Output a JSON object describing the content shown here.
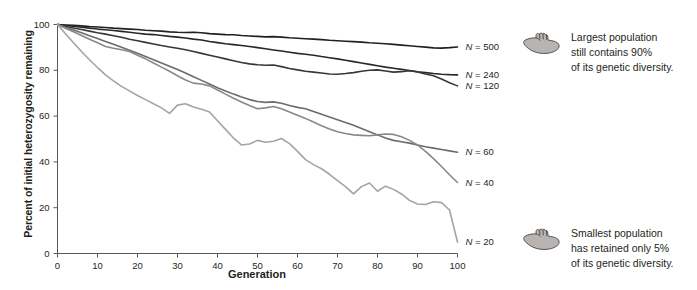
{
  "chart_data": {
    "type": "line",
    "title": "",
    "xlabel": "Generation",
    "ylabel": "Percent of initial heterozygosity remaining",
    "xlim": [
      0,
      100
    ],
    "ylim": [
      0,
      100
    ],
    "xticks": [
      0,
      10,
      20,
      30,
      40,
      50,
      60,
      70,
      80,
      90,
      100
    ],
    "yticks": [
      0,
      20,
      40,
      60,
      80,
      100
    ],
    "grid": false,
    "legend_position": "right-of-line-end",
    "series": [
      {
        "name": "N = 500",
        "label": "N = 500",
        "color": "#231f20",
        "end_value": 90,
        "x": [
          0,
          2,
          4,
          6,
          8,
          10,
          12,
          14,
          16,
          18,
          20,
          22,
          24,
          26,
          28,
          30,
          32,
          34,
          36,
          38,
          40,
          42,
          44,
          46,
          48,
          50,
          52,
          54,
          56,
          58,
          60,
          62,
          64,
          66,
          68,
          70,
          72,
          74,
          76,
          78,
          80,
          82,
          84,
          86,
          88,
          90,
          92,
          94,
          96,
          98,
          100
        ],
        "values": [
          100,
          99.8,
          99.6,
          99.4,
          99.1,
          98.9,
          98.7,
          98.4,
          98.2,
          98.0,
          97.8,
          97.5,
          97.3,
          97.1,
          96.8,
          96.6,
          96.5,
          96.6,
          96.4,
          96.0,
          95.8,
          95.6,
          95.5,
          95.2,
          95.0,
          94.8,
          94.6,
          94.7,
          94.5,
          94.2,
          94.0,
          93.8,
          93.6,
          93.4,
          93.1,
          92.9,
          92.7,
          92.5,
          92.3,
          92.0,
          91.8,
          91.6,
          91.3,
          91.0,
          90.7,
          90.4,
          90.1,
          89.8,
          89.7,
          89.9,
          90.2
        ]
      },
      {
        "name": "N = 240",
        "label": "N = 240",
        "color": "#2b2728",
        "end_value": 78,
        "x": [
          0,
          2,
          4,
          6,
          8,
          10,
          12,
          14,
          16,
          18,
          20,
          22,
          24,
          26,
          28,
          30,
          32,
          34,
          36,
          38,
          40,
          42,
          44,
          46,
          48,
          50,
          52,
          54,
          56,
          58,
          60,
          62,
          64,
          66,
          68,
          70,
          72,
          74,
          76,
          78,
          80,
          82,
          84,
          86,
          88,
          90,
          92,
          94,
          96,
          98,
          100
        ],
        "values": [
          100,
          99.6,
          99.2,
          98.8,
          98.4,
          98.0,
          97.7,
          97.4,
          97.0,
          96.6,
          96.2,
          95.8,
          95.6,
          95.2,
          94.8,
          94.5,
          94.1,
          93.6,
          93.2,
          92.6,
          92.1,
          91.6,
          91.2,
          90.8,
          90.4,
          89.9,
          89.4,
          88.9,
          88.4,
          87.9,
          87.4,
          87.0,
          86.6,
          86.0,
          85.5,
          85.0,
          84.4,
          83.8,
          83.2,
          82.6,
          82.0,
          81.4,
          80.9,
          80.4,
          79.9,
          79.4,
          79.0,
          78.6,
          78.3,
          78.1,
          78.0
        ]
      },
      {
        "name": "N = 120",
        "label": "N = 120",
        "color": "#3a3536",
        "end_value": 73,
        "x": [
          0,
          2,
          4,
          6,
          8,
          10,
          12,
          14,
          16,
          18,
          20,
          22,
          24,
          26,
          28,
          30,
          32,
          34,
          36,
          38,
          40,
          42,
          44,
          46,
          48,
          50,
          52,
          54,
          56,
          58,
          60,
          62,
          64,
          66,
          68,
          70,
          72,
          74,
          76,
          78,
          80,
          82,
          84,
          86,
          88,
          90,
          92,
          94,
          96,
          98,
          100
        ],
        "values": [
          100,
          99.2,
          98.5,
          97.8,
          97.1,
          96.4,
          95.8,
          95.1,
          94.4,
          93.6,
          92.9,
          92.2,
          91.5,
          90.8,
          90.2,
          89.6,
          89.0,
          88.2,
          87.4,
          86.6,
          85.8,
          85.0,
          84.2,
          83.4,
          82.8,
          82.4,
          82.2,
          82.3,
          81.6,
          80.8,
          80.2,
          79.6,
          79.2,
          78.8,
          78.4,
          78.3,
          78.6,
          79.0,
          79.6,
          80.0,
          80.2,
          79.7,
          79.2,
          79.4,
          79.8,
          79.3,
          78.4,
          77.6,
          76.2,
          74.6,
          73.2
        ]
      },
      {
        "name": "N = 60",
        "label": "N = 60",
        "color": "#6d6a6b",
        "end_value": 44,
        "x": [
          0,
          2,
          4,
          6,
          8,
          10,
          12,
          14,
          16,
          18,
          20,
          22,
          24,
          26,
          28,
          30,
          32,
          34,
          36,
          38,
          40,
          42,
          44,
          46,
          48,
          50,
          52,
          54,
          56,
          58,
          60,
          62,
          64,
          66,
          68,
          70,
          72,
          74,
          76,
          78,
          80,
          82,
          84,
          86,
          88,
          90,
          92,
          94,
          96,
          98,
          100
        ],
        "values": [
          100,
          98.8,
          97.6,
          96.4,
          95.1,
          93.9,
          92.6,
          91.4,
          90.1,
          88.8,
          87.4,
          86.0,
          84.6,
          83.2,
          81.8,
          80.3,
          78.8,
          77.2,
          75.6,
          74.0,
          72.4,
          71.0,
          69.6,
          68.3,
          67.2,
          66.4,
          66.0,
          66.2,
          65.6,
          64.6,
          63.8,
          63.2,
          62.0,
          60.8,
          59.6,
          58.4,
          57.2,
          56.0,
          54.6,
          53.2,
          51.8,
          50.4,
          49.4,
          48.8,
          48.2,
          47.4,
          46.6,
          46.0,
          45.4,
          44.8,
          44.2
        ]
      },
      {
        "name": "N = 40",
        "label": "N = 40",
        "color": "#8a8788",
        "end_value": 31,
        "x": [
          0,
          2,
          4,
          6,
          8,
          10,
          12,
          14,
          16,
          18,
          20,
          22,
          24,
          26,
          28,
          30,
          32,
          34,
          36,
          38,
          40,
          42,
          44,
          46,
          48,
          50,
          52,
          54,
          56,
          58,
          60,
          62,
          64,
          66,
          68,
          70,
          72,
          74,
          76,
          78,
          80,
          82,
          84,
          86,
          88,
          90,
          92,
          94,
          96,
          98,
          100
        ],
        "values": [
          100,
          98.4,
          96.8,
          95.2,
          93.6,
          92.0,
          90.4,
          89.6,
          89.0,
          88.2,
          86.6,
          85.0,
          83.2,
          81.4,
          79.6,
          77.6,
          75.8,
          74.4,
          74.0,
          73.2,
          71.4,
          69.6,
          67.8,
          66.2,
          64.6,
          63.2,
          63.6,
          64.2,
          63.2,
          61.8,
          60.4,
          59.0,
          57.4,
          55.8,
          54.4,
          53.2,
          52.4,
          51.8,
          51.6,
          51.4,
          51.8,
          52.2,
          52.0,
          51.0,
          49.4,
          47.4,
          44.6,
          41.4,
          38.0,
          34.4,
          31.0
        ]
      },
      {
        "name": "N = 20",
        "label": "N = 20",
        "color": "#a6a3a4",
        "end_value": 5,
        "x": [
          0,
          2,
          4,
          6,
          8,
          10,
          12,
          14,
          16,
          18,
          20,
          22,
          24,
          26,
          28,
          30,
          32,
          34,
          36,
          38,
          40,
          42,
          44,
          46,
          48,
          50,
          52,
          54,
          56,
          58,
          60,
          62,
          64,
          66,
          68,
          70,
          72,
          74,
          76,
          78,
          80,
          82,
          84,
          86,
          88,
          90,
          92,
          94,
          96,
          98,
          100
        ],
        "values": [
          100,
          96.0,
          92.0,
          88.2,
          84.6,
          81.2,
          78.0,
          75.4,
          73.0,
          71.0,
          69.0,
          67.2,
          65.4,
          63.6,
          61.2,
          64.8,
          65.4,
          64.0,
          63.0,
          61.8,
          58.0,
          54.2,
          50.4,
          47.4,
          47.8,
          49.4,
          48.6,
          49.0,
          50.2,
          48.0,
          44.6,
          41.0,
          38.8,
          37.0,
          34.6,
          31.8,
          29.2,
          26.0,
          29.2,
          30.8,
          27.2,
          29.4,
          28.0,
          26.0,
          23.2,
          21.6,
          21.4,
          22.6,
          22.2,
          19.0,
          5.0
        ]
      }
    ]
  },
  "series_labels": [
    {
      "text": "N = 500",
      "n": "N",
      "eq": " = 500"
    },
    {
      "text": "N = 240",
      "n": "N",
      "eq": " = 240"
    },
    {
      "text": "N = 120",
      "n": "N",
      "eq": " = 120"
    },
    {
      "text": "N = 60",
      "n": "N",
      "eq": " = 60"
    },
    {
      "text": "N = 40",
      "n": "N",
      "eq": " = 40"
    },
    {
      "text": "N = 20",
      "n": "N",
      "eq": " = 20"
    }
  ],
  "annotations": [
    {
      "icon": "pointing-hand-icon",
      "line1": "Largest population",
      "line2": "still contains 90%",
      "line3": "of its genetic diversity."
    },
    {
      "icon": "pointing-hand-icon",
      "line1": "Smallest population",
      "line2": "has retained only 5%",
      "line3": "of its genetic diversity."
    }
  ],
  "axes": {
    "x_title": "Generation",
    "y_title": "Percent of initial heterozygosity remaining",
    "x_ticks": [
      "0",
      "10",
      "20",
      "30",
      "40",
      "50",
      "60",
      "70",
      "80",
      "90",
      "100"
    ],
    "y_ticks": [
      "0",
      "20",
      "40",
      "60",
      "80",
      "100"
    ]
  },
  "colors": {
    "axis": "#58595b",
    "text": "#231f20"
  }
}
